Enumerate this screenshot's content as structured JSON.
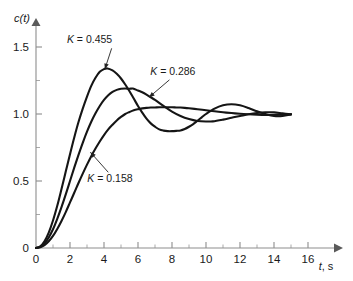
{
  "chart_data": {
    "type": "line",
    "title": "",
    "subtitle": "",
    "xlabel": "t, s",
    "ylabel": "c(t)",
    "xlim": [
      0,
      16.8
    ],
    "ylim": [
      0,
      1.62
    ],
    "grid": false,
    "legend_position": "inline-annotations",
    "x_ticks_major": [
      0,
      2,
      4,
      6,
      8,
      10,
      12,
      14,
      16
    ],
    "x_ticks_minor": [
      1,
      3,
      5,
      7,
      9,
      11,
      13,
      15
    ],
    "x_tick_labels": [
      "0",
      "2",
      "4",
      "6",
      "8",
      "10",
      "12",
      "14",
      "16"
    ],
    "y_ticks_major": [
      0,
      0.5,
      1.0,
      1.5
    ],
    "y_ticks_minor": [
      0.25,
      0.75,
      1.25
    ],
    "y_tick_labels": [
      "0",
      "0.5",
      "1.0",
      "1.5"
    ],
    "annotations": [
      {
        "id": "ann-k455",
        "text": "K = 0.455",
        "symbol": "K",
        "value": 0.455,
        "label_x": 3.15,
        "label_y": 1.56,
        "arrow_from_x": 4.45,
        "arrow_from_y": 1.49,
        "arrow_to_x": 4.05,
        "arrow_to_y": 1.335
      },
      {
        "id": "ann-k286",
        "text": "K = 0.286",
        "symbol": "K",
        "value": 0.286,
        "label_x": 8.05,
        "label_y": 1.32,
        "arrow_from_x": 7.85,
        "arrow_from_y": 1.255,
        "arrow_to_x": 6.65,
        "arrow_to_y": 1.125
      },
      {
        "id": "ann-k158",
        "text": "K = 0.158",
        "symbol": "K",
        "value": 0.158,
        "label_x": 4.35,
        "label_y": 0.525,
        "arrow_from_x": 4.25,
        "arrow_from_y": 0.565,
        "arrow_to_x": 3.2,
        "arrow_to_y": 0.715
      }
    ],
    "series": [
      {
        "name": "K = 0.455",
        "K": 0.455,
        "peak_time": 4.2,
        "peak_value": 1.34,
        "trough_time": 8.5,
        "trough_value": 0.875,
        "settling_value": 1.0,
        "x": [
          0,
          0.25,
          0.5,
          0.75,
          1,
          1.25,
          1.5,
          1.75,
          2,
          2.25,
          2.5,
          2.75,
          3,
          3.25,
          3.5,
          3.75,
          4,
          4.2,
          4.5,
          4.75,
          5,
          5.25,
          5.5,
          5.75,
          6,
          6.25,
          6.5,
          6.75,
          7,
          7.25,
          7.5,
          7.75,
          8,
          8.25,
          8.5,
          8.75,
          9,
          9.25,
          9.5,
          9.75,
          10,
          10.5,
          11,
          11.5,
          12,
          12.5,
          13,
          13.5,
          14,
          14.5,
          15
        ],
        "y": [
          0,
          0.012,
          0.05,
          0.115,
          0.205,
          0.315,
          0.44,
          0.57,
          0.7,
          0.825,
          0.94,
          1.04,
          1.13,
          1.21,
          1.27,
          1.315,
          1.335,
          1.34,
          1.325,
          1.3,
          1.265,
          1.22,
          1.17,
          1.115,
          1.06,
          1.01,
          0.965,
          0.93,
          0.905,
          0.885,
          0.876,
          0.872,
          0.872,
          0.874,
          0.877,
          0.888,
          0.905,
          0.925,
          0.95,
          0.975,
          1.0,
          1.04,
          1.065,
          1.073,
          1.065,
          1.045,
          1.02,
          1.0,
          0.985,
          0.985,
          0.997
        ]
      },
      {
        "name": "K = 0.286",
        "K": 0.286,
        "peak_time": 5.7,
        "peak_value": 1.19,
        "trough_time": 10.4,
        "trough_value": 0.945,
        "settling_value": 1.0,
        "x": [
          0,
          0.25,
          0.5,
          0.75,
          1,
          1.25,
          1.5,
          1.75,
          2,
          2.25,
          2.5,
          2.75,
          3,
          3.25,
          3.5,
          3.75,
          4,
          4.25,
          4.5,
          4.75,
          5,
          5.25,
          5.5,
          5.7,
          6,
          6.25,
          6.5,
          6.75,
          7,
          7.5,
          8,
          8.5,
          9,
          9.5,
          10,
          10.4,
          11,
          11.5,
          12,
          12.5,
          13,
          13.5,
          14,
          14.5,
          15
        ],
        "y": [
          0,
          0.008,
          0.034,
          0.078,
          0.14,
          0.218,
          0.305,
          0.4,
          0.5,
          0.6,
          0.695,
          0.785,
          0.868,
          0.942,
          1.005,
          1.06,
          1.105,
          1.14,
          1.165,
          1.18,
          1.188,
          1.19,
          1.188,
          1.19,
          1.175,
          1.162,
          1.145,
          1.125,
          1.105,
          1.06,
          1.018,
          0.985,
          0.962,
          0.948,
          0.944,
          0.945,
          0.958,
          0.972,
          0.985,
          0.998,
          1.008,
          1.013,
          1.012,
          1.005,
          0.998
        ]
      },
      {
        "name": "K = 0.158",
        "K": 0.158,
        "peak_time": 8.7,
        "peak_value": 1.048,
        "settling_value": 1.0,
        "x": [
          0,
          0.25,
          0.5,
          0.75,
          1,
          1.25,
          1.5,
          1.75,
          2,
          2.25,
          2.5,
          2.75,
          3,
          3.25,
          3.5,
          3.75,
          4,
          4.25,
          4.5,
          4.75,
          5,
          5.25,
          5.5,
          5.75,
          6,
          6.25,
          6.5,
          6.75,
          7,
          7.25,
          7.5,
          7.75,
          8,
          8.25,
          8.5,
          8.75,
          9,
          9.5,
          10,
          10.5,
          11,
          11.5,
          12,
          12.5,
          13,
          13.5,
          14,
          14.5,
          15
        ],
        "y": [
          0,
          0.005,
          0.021,
          0.05,
          0.09,
          0.142,
          0.202,
          0.268,
          0.34,
          0.412,
          0.485,
          0.555,
          0.622,
          0.685,
          0.742,
          0.795,
          0.843,
          0.885,
          0.92,
          0.952,
          0.978,
          1.0,
          1.015,
          1.028,
          1.036,
          1.042,
          1.046,
          1.048,
          1.049,
          1.05,
          1.05,
          1.05,
          1.05,
          1.049,
          1.048,
          1.046,
          1.043,
          1.036,
          1.028,
          1.02,
          1.013,
          1.007,
          1.002,
          0.998,
          0.995,
          0.993,
          0.993,
          0.994,
          0.997
        ]
      }
    ]
  }
}
